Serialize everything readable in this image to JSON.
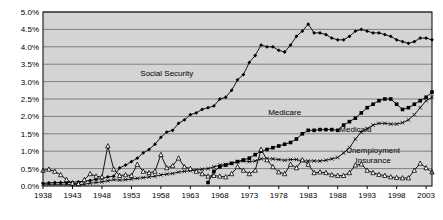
{
  "chart_data": {
    "type": "line",
    "title": "",
    "subtitle": "",
    "xlabel": "",
    "ylabel": "",
    "xlim": [
      1938,
      2004
    ],
    "ylim": [
      0.0,
      5.0
    ],
    "y_tick_labels": [
      "0.0%",
      "0.5%",
      "1.0%",
      "1.5%",
      "2.0%",
      "2.5%",
      "3.0%",
      "3.5%",
      "4.0%",
      "4.5%",
      "5.0%"
    ],
    "y_tick_values": [
      0.0,
      0.5,
      1.0,
      1.5,
      2.0,
      2.5,
      3.0,
      3.5,
      4.0,
      4.5,
      5.0
    ],
    "x_tick_labels": [
      "1938",
      "1943",
      "1948",
      "1953",
      "1958",
      "1963",
      "1968",
      "1973",
      "1978",
      "1983",
      "1988",
      "1993",
      "1998",
      "2003"
    ],
    "x_tick_values": [
      1938,
      1943,
      1948,
      1953,
      1958,
      1963,
      1968,
      1973,
      1978,
      1983,
      1988,
      1993,
      1998,
      2003
    ],
    "grid": "horizontal",
    "plot_background": "#d4d4d4",
    "grid_color": "#808080",
    "axis_color": "#000000",
    "legend_position": "inline-annotations",
    "units": "percent of GDP",
    "series": [
      {
        "name": "Social Security",
        "label": "Social Security",
        "marker": "filled-diamond",
        "color": "#000000",
        "label_x": 1959,
        "label_y": 3.15,
        "x": [
          1938,
          1939,
          1940,
          1941,
          1942,
          1943,
          1944,
          1945,
          1946,
          1947,
          1948,
          1949,
          1950,
          1951,
          1952,
          1953,
          1954,
          1955,
          1956,
          1957,
          1958,
          1959,
          1960,
          1961,
          1962,
          1963,
          1964,
          1965,
          1966,
          1967,
          1968,
          1969,
          1970,
          1971,
          1972,
          1973,
          1974,
          1975,
          1976,
          1977,
          1978,
          1979,
          1980,
          1981,
          1982,
          1983,
          1984,
          1985,
          1986,
          1987,
          1988,
          1989,
          1990,
          1991,
          1992,
          1993,
          1994,
          1995,
          1996,
          1997,
          1998,
          1999,
          2000,
          2001,
          2002,
          2003,
          2004
        ],
        "values": [
          0.07,
          0.09,
          0.1,
          0.1,
          0.1,
          0.11,
          0.12,
          0.14,
          0.16,
          0.19,
          0.22,
          0.26,
          0.28,
          0.52,
          0.6,
          0.7,
          0.8,
          0.95,
          1.05,
          1.2,
          1.4,
          1.55,
          1.6,
          1.8,
          1.9,
          2.05,
          2.1,
          2.2,
          2.25,
          2.3,
          2.5,
          2.55,
          2.75,
          3.05,
          3.2,
          3.55,
          3.75,
          4.05,
          4.0,
          4.0,
          3.9,
          3.85,
          4.05,
          4.3,
          4.45,
          4.65,
          4.4,
          4.4,
          4.35,
          4.25,
          4.2,
          4.2,
          4.3,
          4.45,
          4.5,
          4.45,
          4.4,
          4.4,
          4.35,
          4.3,
          4.2,
          4.15,
          4.1,
          4.15,
          4.25,
          4.25,
          4.2
        ]
      },
      {
        "name": "Medicare",
        "label": "Medicare",
        "marker": "filled-square",
        "color": "#000000",
        "label_x": 1979,
        "label_y": 2.05,
        "x": [
          1966,
          1967,
          1968,
          1969,
          1970,
          1971,
          1972,
          1973,
          1974,
          1975,
          1976,
          1977,
          1978,
          1979,
          1980,
          1981,
          1982,
          1983,
          1984,
          1985,
          1986,
          1987,
          1988,
          1989,
          1990,
          1991,
          1992,
          1993,
          1994,
          1995,
          1996,
          1997,
          1998,
          1999,
          2000,
          2001,
          2002,
          2003,
          2004
        ],
        "values": [
          0.1,
          0.42,
          0.55,
          0.6,
          0.65,
          0.7,
          0.75,
          0.8,
          0.9,
          1.0,
          1.05,
          1.1,
          1.15,
          1.2,
          1.25,
          1.35,
          1.5,
          1.6,
          1.6,
          1.62,
          1.62,
          1.62,
          1.6,
          1.75,
          1.85,
          1.95,
          2.1,
          2.25,
          2.35,
          2.45,
          2.5,
          2.5,
          2.35,
          2.2,
          2.25,
          2.35,
          2.45,
          2.55,
          2.7
        ]
      },
      {
        "name": "Medicaid",
        "label": "Medicaid",
        "marker": "x",
        "color": "#000000",
        "label_x": 1991,
        "label_y": 1.55,
        "x": [
          1938,
          1939,
          1940,
          1941,
          1942,
          1943,
          1944,
          1945,
          1946,
          1947,
          1948,
          1949,
          1950,
          1951,
          1952,
          1953,
          1954,
          1955,
          1956,
          1957,
          1958,
          1959,
          1960,
          1961,
          1962,
          1963,
          1964,
          1965,
          1966,
          1967,
          1968,
          1969,
          1970,
          1971,
          1972,
          1973,
          1974,
          1975,
          1976,
          1977,
          1978,
          1979,
          1980,
          1981,
          1982,
          1983,
          1984,
          1985,
          1986,
          1987,
          1988,
          1989,
          1990,
          1991,
          1992,
          1993,
          1994,
          1995,
          1996,
          1997,
          1998,
          1999,
          2000,
          2001,
          2002,
          2003,
          2004
        ],
        "values": [
          0.05,
          0.05,
          0.05,
          0.05,
          0.05,
          0.04,
          0.04,
          0.05,
          0.08,
          0.1,
          0.12,
          0.15,
          0.18,
          0.17,
          0.18,
          0.2,
          0.22,
          0.24,
          0.26,
          0.28,
          0.32,
          0.34,
          0.36,
          0.4,
          0.42,
          0.44,
          0.46,
          0.48,
          0.5,
          0.55,
          0.6,
          0.62,
          0.65,
          0.7,
          0.72,
          0.7,
          0.72,
          0.78,
          0.78,
          0.78,
          0.76,
          0.74,
          0.76,
          0.76,
          0.72,
          0.72,
          0.72,
          0.72,
          0.74,
          0.78,
          0.82,
          0.95,
          1.1,
          1.35,
          1.55,
          1.65,
          1.75,
          1.8,
          1.8,
          1.78,
          1.78,
          1.82,
          1.9,
          2.05,
          2.25,
          2.45,
          2.55
        ]
      },
      {
        "name": "Unemployment Insurance",
        "label": "Unemployment Insurance",
        "label_line1": "Unemployment",
        "label_line2": "Insurance",
        "marker": "open-triangle",
        "color": "#000000",
        "label_x": 1994,
        "label_y": 0.95,
        "x": [
          1938,
          1939,
          1940,
          1941,
          1942,
          1943,
          1944,
          1945,
          1946,
          1947,
          1948,
          1949,
          1950,
          1951,
          1952,
          1953,
          1954,
          1955,
          1956,
          1957,
          1958,
          1959,
          1960,
          1961,
          1962,
          1963,
          1964,
          1965,
          1966,
          1967,
          1968,
          1969,
          1970,
          1971,
          1972,
          1973,
          1974,
          1975,
          1976,
          1977,
          1978,
          1979,
          1980,
          1981,
          1982,
          1983,
          1984,
          1985,
          1986,
          1987,
          1988,
          1989,
          1990,
          1991,
          1992,
          1993,
          1994,
          1995,
          1996,
          1997,
          1998,
          1999,
          2000,
          2001,
          2002,
          2003,
          2004
        ],
        "values": [
          0.45,
          0.48,
          0.42,
          0.32,
          0.18,
          0.08,
          0.06,
          0.18,
          0.35,
          0.28,
          0.26,
          1.15,
          0.48,
          0.3,
          0.32,
          0.3,
          0.62,
          0.42,
          0.38,
          0.42,
          0.9,
          0.52,
          0.58,
          0.8,
          0.55,
          0.5,
          0.42,
          0.35,
          0.28,
          0.3,
          0.28,
          0.26,
          0.35,
          0.55,
          0.45,
          0.35,
          0.45,
          1.05,
          0.75,
          0.55,
          0.4,
          0.35,
          0.62,
          0.52,
          0.75,
          0.62,
          0.38,
          0.4,
          0.38,
          0.32,
          0.3,
          0.3,
          0.38,
          0.6,
          0.63,
          0.45,
          0.38,
          0.33,
          0.3,
          0.26,
          0.24,
          0.23,
          0.23,
          0.45,
          0.65,
          0.52,
          0.4
        ]
      }
    ]
  }
}
